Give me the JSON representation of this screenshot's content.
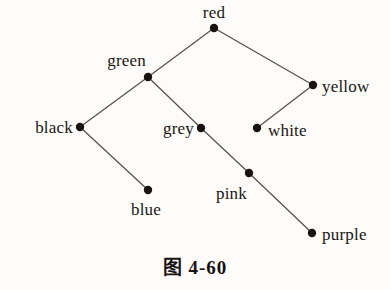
{
  "figure": {
    "caption": "图 4-60",
    "background_color": "#fdfcfa",
    "edge_color": "#55504d",
    "node_color": "#1a1210",
    "label_color": "#1a1614",
    "node_radius": 4.2,
    "edge_width": 1.25
  },
  "graph": {
    "type": "tree",
    "nodes": [
      {
        "id": "red",
        "label": "red",
        "x": 214,
        "y": 28,
        "label_x": 214,
        "label_y": 12,
        "anchor": "center"
      },
      {
        "id": "green",
        "label": "green",
        "x": 148,
        "y": 77,
        "label_x": 146,
        "label_y": 60,
        "anchor": "right"
      },
      {
        "id": "yellow",
        "label": "yellow",
        "x": 313,
        "y": 85,
        "label_x": 322,
        "label_y": 86,
        "anchor": "left"
      },
      {
        "id": "black",
        "label": "black",
        "x": 80,
        "y": 127,
        "label_x": 73,
        "label_y": 127,
        "anchor": "right"
      },
      {
        "id": "grey",
        "label": "grey",
        "x": 201,
        "y": 128,
        "label_x": 194,
        "label_y": 128,
        "anchor": "right"
      },
      {
        "id": "white",
        "label": "white",
        "x": 257,
        "y": 128,
        "label_x": 268,
        "label_y": 130,
        "anchor": "left"
      },
      {
        "id": "blue",
        "label": "blue",
        "x": 148,
        "y": 190,
        "label_x": 146,
        "label_y": 209,
        "anchor": "center"
      },
      {
        "id": "pink",
        "label": "pink",
        "x": 249,
        "y": 173,
        "label_x": 247,
        "label_y": 193,
        "anchor": "right"
      },
      {
        "id": "purple",
        "label": "purple",
        "x": 312,
        "y": 233,
        "label_x": 322,
        "label_y": 234,
        "anchor": "left"
      }
    ],
    "edges": [
      {
        "from": "red",
        "to": "green"
      },
      {
        "from": "red",
        "to": "yellow"
      },
      {
        "from": "green",
        "to": "black"
      },
      {
        "from": "green",
        "to": "grey"
      },
      {
        "from": "yellow",
        "to": "white"
      },
      {
        "from": "black",
        "to": "blue"
      },
      {
        "from": "grey",
        "to": "pink"
      },
      {
        "from": "pink",
        "to": "purple"
      }
    ]
  }
}
